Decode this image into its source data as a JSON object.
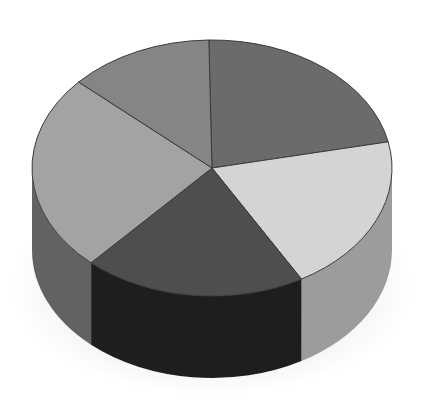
{
  "chart_data": {
    "type": "pie",
    "style": "3d",
    "title": "",
    "categories": [
      "Slice A",
      "Slice B",
      "Slice C",
      "Slice D",
      "Slice E"
    ],
    "values": [
      22,
      20,
      20,
      25,
      13
    ],
    "labels_visible": false,
    "legend": "none",
    "colors_top": [
      "#6b6b6b",
      "#d4d4d4",
      "#4e4e4e",
      "#a3a3a3",
      "#858585"
    ],
    "colors_side": [
      "#5a5a5a",
      "#9c9c9c",
      "#1e1e1e",
      "#626262",
      "#6e6e6e"
    ]
  }
}
